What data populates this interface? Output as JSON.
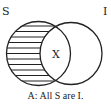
{
  "diagram": {
    "type": "venn",
    "sets": [
      {
        "label": "S",
        "cx": 38.5,
        "cy": 53.5,
        "r": 32,
        "shading": "horizontal-lines outside overlap"
      },
      {
        "label": "I",
        "cx": 71,
        "cy": 53.5,
        "r": 31,
        "shading": "none"
      }
    ],
    "overlap_mark": "X",
    "caption": "A: All S are I.",
    "colors": {
      "stroke": "#222222",
      "background": "#ffffff"
    }
  }
}
